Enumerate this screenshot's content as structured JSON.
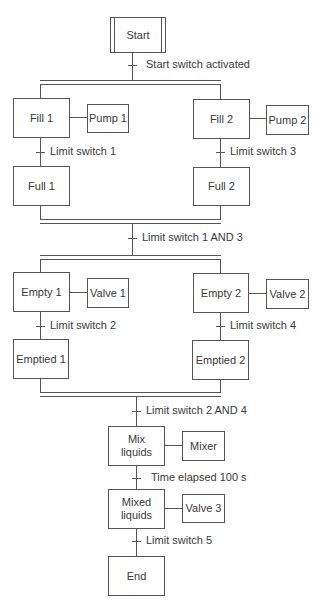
{
  "diagram": {
    "type": "sequential function chart",
    "steps": {
      "start": "Start",
      "fill1": "Fill 1",
      "fill2": "Fill 2",
      "full1": "Full 1",
      "full2": "Full 2",
      "empty1": "Empty 1",
      "empty2": "Empty 2",
      "emptied1": "Emptied 1",
      "emptied2": "Emptied 2",
      "mix_line1": "Mix",
      "mix_line2": "liquids",
      "mixed_line1": "Mixed",
      "mixed_line2": "liquids",
      "end": "End"
    },
    "actions": {
      "pump1": "Pump 1",
      "pump2": "Pump 2",
      "valve1": "Valve 1",
      "valve2": "Valve 2",
      "mixer": "Mixer",
      "valve3": "Valve 3"
    },
    "transitions": {
      "t0": "Start switch activated",
      "t1": "Limit switch 1",
      "t3": "Limit switch 3",
      "t13": "Limit switch 1 AND 3",
      "t2": "Limit switch 2",
      "t4": "Limit switch 4",
      "t24": "Limit switch 2 AND 4",
      "t100": "Time elapsed 100 s",
      "t5": "Limit switch 5"
    }
  }
}
